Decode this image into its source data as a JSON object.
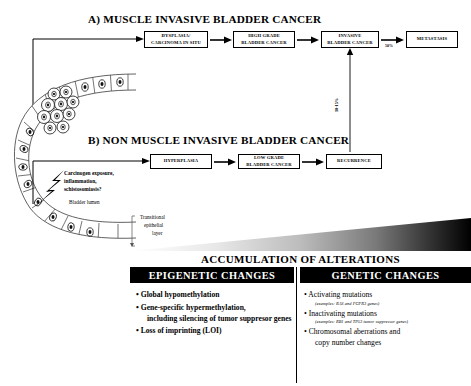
{
  "sections": {
    "a_title": "A) MUSCLE INVASIVE BLADDER CANCER",
    "b_title": "B) NON MUSCLE INVASIVE BLADDER CANCER"
  },
  "pathway_a": {
    "boxes": [
      {
        "name": "dysplasia-cis",
        "line1": "DYSPLASIA/",
        "line2": "CARCINOMA IN SITU"
      },
      {
        "name": "high-grade",
        "line1": "HIGH GRADE",
        "line2": "BLADDER CANCER"
      },
      {
        "name": "invasive",
        "line1": "INVASIVE",
        "line2": "BLADDER CANCER"
      },
      {
        "name": "metastasis",
        "line1": "METASTASIS",
        "line2": ""
      }
    ],
    "metastasis_rate": "50%"
  },
  "pathway_b": {
    "boxes": [
      {
        "name": "hyperplasia",
        "line1": "HYPERPLASIA",
        "line2": ""
      },
      {
        "name": "low-grade",
        "line1": "LOW GRADE",
        "line2": "BLADDER CANCER"
      },
      {
        "name": "recurrence",
        "line1": "RECURRENCE",
        "line2": ""
      }
    ],
    "progression_rate": "10-15%"
  },
  "anatomy": {
    "carcinogen_line1": "Carcinogen exposure,",
    "carcinogen_line2": "inflammation,",
    "carcinogen_line3": "schistosomiasis?",
    "lumen_label": "Bladder lumen",
    "epithelium_line1": "Transitional",
    "epithelium_line2": "epithelial",
    "epithelium_line3": "layer"
  },
  "accumulation": {
    "title": "ACCUMULATION OF ALTERATIONS",
    "columns": [
      {
        "header": "EPIGENETIC CHANGES",
        "items": [
          {
            "text": "Global hypomethylation",
            "bold": true,
            "cont": "",
            "example": ""
          },
          {
            "text": "Gene-specific hypermethylation,",
            "bold": true,
            "cont": "including silencing of tumor suppresor genes",
            "example": ""
          },
          {
            "text": "Loss of imprinting (LOI)",
            "bold": true,
            "cont": "",
            "example": ""
          }
        ]
      },
      {
        "header": "GENETIC CHANGES",
        "items": [
          {
            "text": "Activating mutations",
            "bold": true,
            "cont": "",
            "example": "(examples: RAS and FGFR3 genes)"
          },
          {
            "text": "Inactivating mutations",
            "bold": true,
            "cont": "",
            "example": "(examples: RB1 and TP53 tumor suppressor genes)"
          },
          {
            "text": "Chromosomal aberrations and",
            "bold": true,
            "cont": "copy number changes",
            "example": ""
          }
        ]
      }
    ]
  },
  "colors": {
    "ink": "#000000",
    "paper": "#ffffff",
    "bar_bg": "#000000",
    "bar_fg": "#ffffff"
  }
}
